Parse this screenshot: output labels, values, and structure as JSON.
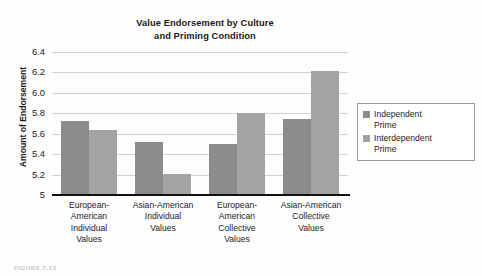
{
  "chart_data": {
    "type": "bar",
    "title": "Value Endorsement by Culture and Priming Condition",
    "title_lines": [
      "Value Endorsement by Culture",
      "and Priming Condition"
    ],
    "xlabel": "",
    "ylabel": "Amount of Endorsement",
    "ylim": [
      5.0,
      6.4
    ],
    "grid": true,
    "legend_position": "right",
    "categories": [
      "European-American Individual Values",
      "Asian-American Individual Values",
      "European-American Collective Values",
      "Asian-American Collective Values"
    ],
    "category_lines": [
      [
        "European-",
        "American",
        "Individual",
        "Values"
      ],
      [
        "Asian-American",
        "Individual",
        "Values"
      ],
      [
        "European-",
        "American",
        "Collective",
        "Values"
      ],
      [
        "Asian-American",
        "Collective",
        "Values"
      ]
    ],
    "ytick_labels": [
      "6.4",
      "6.2",
      "6.0",
      "5.8",
      "5.6",
      "5.4",
      "5.2",
      "5"
    ],
    "ytick_values": [
      6.4,
      6.2,
      6.0,
      5.8,
      5.6,
      5.4,
      5.2,
      5.0
    ],
    "series": [
      {
        "name": "Independent Prime",
        "name_lines": [
          "Independent",
          "Prime"
        ],
        "color": "#8c8c8c",
        "values": [
          5.72,
          5.52,
          5.5,
          5.74
        ]
      },
      {
        "name": "Interdependent Prime",
        "name_lines": [
          "Interdependent",
          "Prime"
        ],
        "color": "#a3a3a3",
        "values": [
          5.64,
          5.21,
          5.8,
          6.21
        ]
      }
    ]
  },
  "caption": {
    "text": "FIGURE 7.12"
  }
}
